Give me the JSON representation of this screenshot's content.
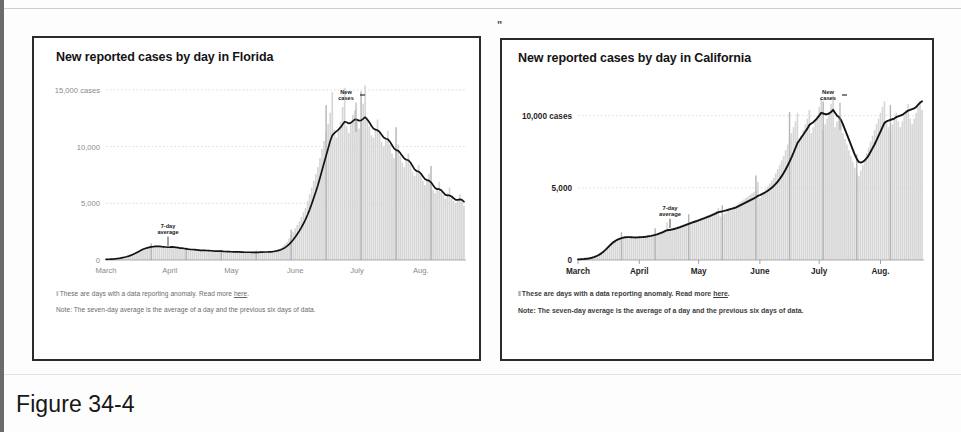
{
  "page": {
    "figure_caption": "Figure 34-4",
    "quote_mark": "\"",
    "accent_color": "#2b2b2b",
    "line_color": "#141414",
    "bar_color": "#d8d8d8",
    "text_color": "#4a4a4a"
  },
  "charts": [
    {
      "id": "florida",
      "title": "New reported cases by day in Florida",
      "annotations": {
        "new_cases": "New cases",
        "seven_day": "7-day average"
      },
      "footnotes": [
        {
          "glyph": "II",
          "text": "These are days with a data reporting anomaly. Read more ",
          "link": "here",
          "tail": "."
        },
        {
          "glyph": "",
          "text": "Note: The seven-day average is the average of a day and the previous six days of data.",
          "link": "",
          "tail": ""
        }
      ],
      "chart_data": {
        "type": "area",
        "title": "New reported cases by day in Florida",
        "xlabel": "",
        "ylabel": "cases",
        "ylim": [
          0,
          15000
        ],
        "grid": true,
        "legend": "inline-annotations",
        "y_ticks": [
          0,
          5000,
          10000,
          15000
        ],
        "y_tick_labels": [
          "0",
          "5,000",
          "10,000",
          "15,000 cases"
        ],
        "x_ticks": [
          0,
          31,
          61,
          92,
          122,
          153
        ],
        "x_tick_labels": [
          "March",
          "April",
          "May",
          "June",
          "July",
          "Aug."
        ],
        "x_range": [
          0,
          175
        ],
        "series": [
          {
            "name": "New cases",
            "type": "bar",
            "values": [
              40,
              55,
              60,
              70,
              90,
              110,
              140,
              170,
              210,
              250,
              300,
              360,
              420,
              500,
              600,
              700,
              800,
              900,
              1000,
              1050,
              1100,
              1150,
              1200,
              1180,
              1220,
              1250,
              1180,
              1100,
              1150,
              1100,
              1080,
              1150,
              1200,
              1100,
              1050,
              1000,
              980,
              1020,
              960,
              900,
              880,
              920,
              950,
              900,
              870,
              840,
              800,
              830,
              860,
              820,
              790,
              760,
              740,
              770,
              800,
              760,
              720,
              700,
              730,
              760,
              740,
              700,
              680,
              710,
              740,
              700,
              670,
              650,
              680,
              710,
              690,
              660,
              640,
              670,
              700,
              720,
              740,
              700,
              680,
              710,
              760,
              800,
              850,
              900,
              950,
              1050,
              1200,
              1400,
              1600,
              1900,
              2200,
              2500,
              2800,
              3100,
              3400,
              3800,
              4200,
              4600,
              5200,
              5800,
              6400,
              7000,
              7600,
              8200,
              9000,
              9800,
              10500,
              11200,
              12000,
              13000,
              14800,
              11500,
              10800,
              11500,
              12200,
              13500,
              15200,
              11800,
              11200,
              12000,
              12800,
              13200,
              12400,
              11600,
              12200,
              13800,
              15400,
              12600,
              11800,
              11000,
              10800,
              11600,
              12400,
              11200,
              10400,
              10000,
              10600,
              11400,
              10200,
              9400,
              9000,
              9600,
              10200,
              9200,
              8600,
              8200,
              8800,
              9400,
              8400,
              7800,
              7400,
              7900,
              8400,
              7600,
              7000,
              6600,
              7100,
              7600,
              6800,
              6200,
              5900,
              6400,
              6900,
              6200,
              5700,
              5400,
              5900,
              6400,
              5700,
              5200,
              5000,
              5400,
              5800,
              5200,
              4800
            ]
          },
          {
            "name": "7-day average",
            "type": "line",
            "values": [
              60,
              65,
              70,
              80,
              95,
              115,
              140,
              170,
              205,
              245,
              290,
              345,
              405,
              480,
              570,
              665,
              760,
              855,
              945,
              1010,
              1070,
              1120,
              1165,
              1180,
              1200,
              1215,
              1200,
              1175,
              1165,
              1145,
              1125,
              1135,
              1150,
              1140,
              1115,
              1085,
              1055,
              1040,
              1015,
              985,
              955,
              935,
              925,
              910,
              895,
              875,
              855,
              845,
              845,
              840,
              830,
              815,
              800,
              790,
              790,
              785,
              775,
              760,
              750,
              745,
              740,
              730,
              720,
              715,
              715,
              710,
              700,
              690,
              685,
              685,
              685,
              680,
              675,
              675,
              680,
              690,
              700,
              705,
              705,
              710,
              725,
              745,
              775,
              810,
              850,
              905,
              985,
              1090,
              1220,
              1380,
              1570,
              1790,
              2030,
              2290,
              2570,
              2880,
              3220,
              3580,
              3990,
              4450,
              4950,
              5480,
              6030,
              6600,
              7230,
              7900,
              8560,
              9200,
              9850,
              10500,
              11000,
              11200,
              11350,
              11500,
              11700,
              11950,
              12200,
              12150,
              12050,
              12100,
              12250,
              12400,
              12380,
              12300,
              12320,
              12450,
              12600,
              12400,
              12150,
              11850,
              11600,
              11500,
              11450,
              11300,
              11050,
              10800,
              10700,
              10650,
              10450,
              10150,
              9850,
              9700,
              9650,
              9450,
              9200,
              8950,
              8850,
              8800,
              8600,
              8300,
              8000,
              7850,
              7800,
              7650,
              7400,
              7150,
              7050,
              7000,
              6850,
              6600,
              6350,
              6250,
              6250,
              6150,
              5950,
              5750,
              5700,
              5700,
              5600,
              5450,
              5300,
              5300,
              5350,
              5300,
              5150
            ]
          }
        ]
      }
    },
    {
      "id": "california",
      "title": "New reported cases by day in California",
      "annotations": {
        "new_cases": "New cases",
        "seven_day": "7-day average"
      },
      "footnotes": [
        {
          "glyph": "II",
          "text": "These are days with a data reporting anomaly. Read more ",
          "link": "here",
          "tail": "."
        },
        {
          "glyph": "",
          "text": "Note: The seven-day average is the average of a day and the previous six days of data.",
          "link": "",
          "tail": ""
        }
      ],
      "chart_data": {
        "type": "area",
        "title": "New reported cases by day in California",
        "xlabel": "",
        "ylabel": "cases",
        "ylim": [
          0,
          11500
        ],
        "grid": true,
        "legend": "inline-annotations",
        "y_ticks": [
          0,
          5000,
          10000
        ],
        "y_tick_labels": [
          "0",
          "5,000",
          "10,000 cases"
        ],
        "x_ticks": [
          0,
          31,
          61,
          92,
          122,
          153
        ],
        "x_tick_labels": [
          "March",
          "April",
          "May",
          "June",
          "July",
          "Aug."
        ],
        "x_range": [
          0,
          175
        ],
        "series": [
          {
            "name": "New cases",
            "type": "bar",
            "values": [
              30,
              40,
              50,
              60,
              80,
              100,
              130,
              160,
              200,
              250,
              320,
              400,
              500,
              620,
              760,
              900,
              1050,
              1180,
              1300,
              1400,
              1480,
              1540,
              1580,
              1600,
              1620,
              1600,
              1580,
              1560,
              1540,
              1560,
              1580,
              1600,
              1620,
              1600,
              1640,
              1680,
              1700,
              1720,
              1760,
              1800,
              1840,
              1900,
              1960,
              2020,
              2100,
              2600,
              2000,
              2080,
              2160,
              2200,
              2260,
              2320,
              2400,
              2450,
              2500,
              2560,
              2600,
              2650,
              2700,
              2750,
              2800,
              2850,
              2900,
              2950,
              3000,
              3060,
              3120,
              3180,
              3240,
              3300,
              3400,
              3600,
              3000,
              3100,
              3200,
              3300,
              3400,
              3500,
              3600,
              3700,
              3800,
              3900,
              4000,
              4100,
              4200,
              4300,
              4400,
              4500,
              4600,
              4700,
              4800,
              5400,
              4300,
              4500,
              4700,
              4900,
              5100,
              5300,
              5500,
              5700,
              6000,
              6300,
              6600,
              6900,
              7200,
              7600,
              8000,
              8400,
              8800,
              9200,
              9600,
              10200,
              8200,
              8600,
              9000,
              9400,
              9800,
              10400,
              8800,
              9200,
              9600,
              10000,
              10600,
              11200,
              9000,
              9400,
              9800,
              10200,
              10800,
              11400,
              9200,
              9600,
              10000,
              9400,
              8800,
              8400,
              8000,
              7600,
              7200,
              6800,
              6400,
              6000,
              5800,
              6200,
              6600,
              7000,
              7400,
              7800,
              8200,
              8600,
              9000,
              9400,
              9800,
              10200,
              10600,
              11000,
              9600,
              9200,
              8800,
              9400,
              9800,
              10200,
              9600,
              9200,
              9600,
              10000,
              10400,
              10800,
              9800,
              9400,
              9800,
              10200,
              10600,
              11000,
              10400
            ]
          },
          {
            "name": "7-day average",
            "type": "line",
            "values": [
              45,
              50,
              58,
              68,
              82,
              100,
              125,
              158,
              198,
              248,
              312,
              390,
              485,
              595,
              720,
              855,
              995,
              1125,
              1240,
              1335,
              1410,
              1470,
              1515,
              1550,
              1575,
              1585,
              1585,
              1575,
              1565,
              1560,
              1565,
              1575,
              1585,
              1590,
              1605,
              1625,
              1650,
              1675,
              1705,
              1740,
              1780,
              1825,
              1875,
              1930,
              1995,
              2060,
              2080,
              2100,
              2130,
              2165,
              2205,
              2250,
              2300,
              2350,
              2400,
              2450,
              2500,
              2550,
              2600,
              2650,
              2700,
              2750,
              2800,
              2850,
              2900,
              2955,
              3010,
              3065,
              3120,
              3180,
              3250,
              3320,
              3340,
              3370,
              3400,
              3440,
              3480,
              3520,
              3560,
              3600,
              3650,
              3710,
              3780,
              3850,
              3920,
              3990,
              4060,
              4130,
              4200,
              4270,
              4350,
              4450,
              4500,
              4560,
              4630,
              4710,
              4800,
              4900,
              5010,
              5130,
              5270,
              5430,
              5610,
              5810,
              6030,
              6270,
              6530,
              6810,
              7110,
              7430,
              7760,
              8100,
              8300,
              8500,
              8700,
              8900,
              9100,
              9350,
              9450,
              9550,
              9680,
              9830,
              10000,
              10200,
              10150,
              10100,
              10100,
              10150,
              10250,
              10400,
              10200,
              10000,
              9900,
              9700,
              9400,
              9050,
              8700,
              8350,
              8000,
              7650,
              7300,
              7000,
              6800,
              6750,
              6800,
              6900,
              7050,
              7250,
              7500,
              7750,
              8000,
              8300,
              8600,
              8900,
              9200,
              9500,
              9600,
              9650,
              9700,
              9750,
              9800,
              9900,
              9950,
              10000,
              10050,
              10150,
              10250,
              10350,
              10400,
              10450,
              10500,
              10600,
              10750,
              10900,
              11000
            ]
          }
        ]
      }
    }
  ]
}
